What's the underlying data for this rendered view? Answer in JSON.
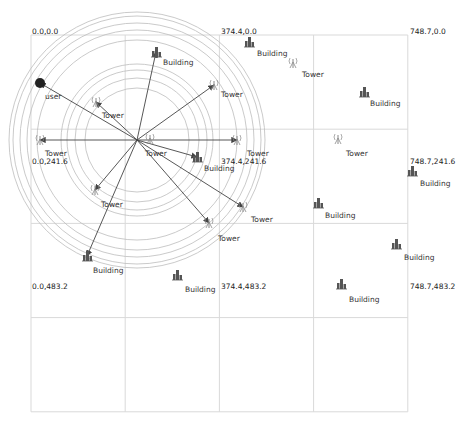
{
  "grid": {
    "origin_px": [
      31,
      35
    ],
    "cell_px": 94.2,
    "cols": 4,
    "rows": 4,
    "line_color": "#d9d9d9",
    "coord_labels": [
      {
        "text": "0.0,0.0",
        "x": 32,
        "y": 28
      },
      {
        "text": "374.4,0.0",
        "x": 221,
        "y": 28
      },
      {
        "text": "748.7,0.0",
        "x": 410,
        "y": 28
      },
      {
        "text": "0.0,241.6",
        "x": 32,
        "y": 158
      },
      {
        "text": "374.4,241.6",
        "x": 221,
        "y": 158
      },
      {
        "text": "748.7,241.6",
        "x": 410,
        "y": 158
      },
      {
        "text": "0.0,483.2",
        "x": 32,
        "y": 283
      },
      {
        "text": "374.4,483.2",
        "x": 221,
        "y": 283
      },
      {
        "text": "748.7,483.2",
        "x": 410,
        "y": 283
      }
    ]
  },
  "coverage": {
    "center": [
      137,
      140
    ],
    "radii": [
      128,
      124,
      117,
      110,
      100,
      76,
      70,
      62,
      52
    ],
    "circle_color": "#bdbdbd"
  },
  "user": {
    "label": "user",
    "pos": [
      40,
      83
    ],
    "label_pos": [
      45,
      93
    ],
    "color": "#222222"
  },
  "towers": [
    {
      "label": "Tower",
      "icon": [
        96,
        102
      ],
      "label_pos": [
        102,
        112
      ]
    },
    {
      "label": "Tower",
      "icon": [
        214,
        85
      ],
      "label_pos": [
        221,
        91
      ]
    },
    {
      "label": "Tower",
      "icon": [
        293,
        63
      ],
      "label_pos": [
        302,
        71
      ]
    },
    {
      "label": "Tower",
      "icon": [
        40,
        140
      ],
      "label_pos": [
        45,
        150
      ]
    },
    {
      "label": "Tower",
      "icon": [
        150,
        139
      ],
      "label_pos": [
        145,
        150
      ]
    },
    {
      "label": "Tower",
      "icon": [
        237,
        140
      ],
      "label_pos": [
        247,
        150
      ]
    },
    {
      "label": "Tower",
      "icon": [
        338,
        139
      ],
      "label_pos": [
        346,
        150
      ]
    },
    {
      "label": "Tower",
      "icon": [
        95,
        190
      ],
      "label_pos": [
        101,
        201
      ]
    },
    {
      "label": "Tower",
      "icon": [
        243,
        207
      ],
      "label_pos": [
        251,
        216
      ]
    },
    {
      "label": "Tower",
      "icon": [
        209,
        223
      ],
      "label_pos": [
        218,
        235
      ]
    }
  ],
  "buildings": [
    {
      "label": "Building",
      "icon": [
        156,
        52
      ],
      "label_pos": [
        163,
        59
      ]
    },
    {
      "label": "Building",
      "icon": [
        249,
        42
      ],
      "label_pos": [
        257,
        50
      ]
    },
    {
      "label": "Building",
      "icon": [
        364,
        92
      ],
      "label_pos": [
        370,
        100
      ]
    },
    {
      "label": "Building",
      "icon": [
        197,
        157
      ],
      "label_pos": [
        204,
        165
      ]
    },
    {
      "label": "Building",
      "icon": [
        412,
        171
      ],
      "label_pos": [
        420,
        180
      ]
    },
    {
      "label": "Building",
      "icon": [
        318,
        203
      ],
      "label_pos": [
        325,
        212
      ]
    },
    {
      "label": "Building",
      "icon": [
        396,
        244
      ],
      "label_pos": [
        404,
        254
      ]
    },
    {
      "label": "Building",
      "icon": [
        87,
        256
      ],
      "label_pos": [
        93,
        267
      ]
    },
    {
      "label": "Building",
      "icon": [
        177,
        275
      ],
      "label_pos": [
        185,
        286
      ]
    },
    {
      "label": "Building",
      "icon": [
        341,
        284
      ],
      "label_pos": [
        349,
        296
      ]
    }
  ],
  "links": [
    {
      "to": [
        40,
        83
      ]
    },
    {
      "to": [
        96,
        102
      ]
    },
    {
      "to": [
        156,
        52
      ]
    },
    {
      "to": [
        214,
        85
      ]
    },
    {
      "to": [
        40,
        140
      ]
    },
    {
      "to": [
        197,
        157
      ]
    },
    {
      "to": [
        243,
        207
      ]
    },
    {
      "to": [
        209,
        223
      ]
    },
    {
      "to": [
        95,
        190
      ]
    },
    {
      "to": [
        87,
        256
      ]
    },
    {
      "to": [
        237,
        140
      ]
    }
  ],
  "link_color": "#444444",
  "icon_color": "#555555",
  "tower_color": "#888888"
}
